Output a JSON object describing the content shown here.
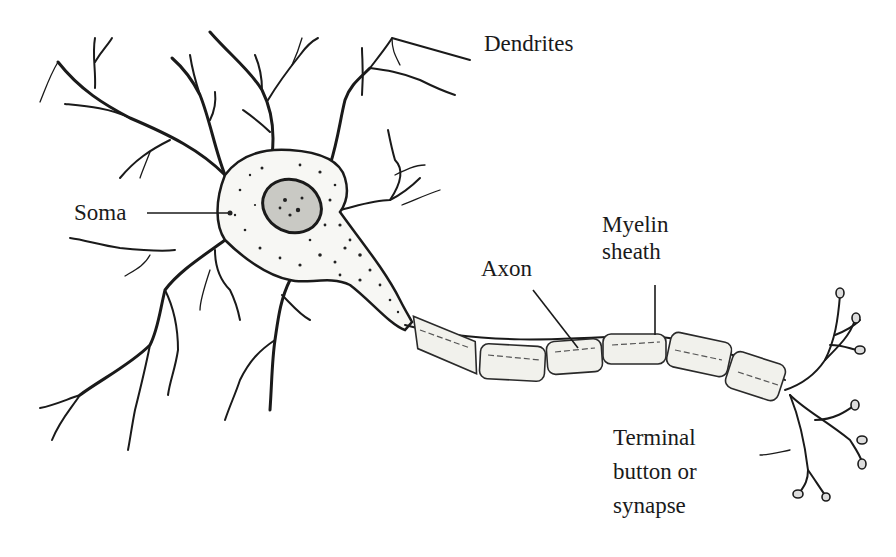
{
  "diagram": {
    "labels": {
      "dendrites": "Dendrites",
      "soma": "Soma",
      "axon": "Axon",
      "myelin_line1": "Myelin",
      "myelin_line2": "sheath",
      "terminal_line1": "Terminal",
      "terminal_line2": "button or",
      "terminal_line3": "synapse"
    },
    "parts": [
      "dendrites",
      "soma",
      "nucleus",
      "axon",
      "myelin sheath",
      "terminal buttons"
    ],
    "colors": {
      "ink": "#1a1a1a",
      "background": "#ffffff",
      "myelin_fill": "#f1f1ec"
    }
  }
}
